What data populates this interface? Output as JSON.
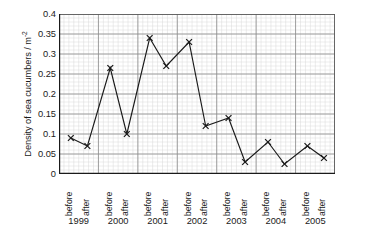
{
  "chart_data": {
    "type": "line",
    "title": "",
    "subtitle": "",
    "xlabel": "",
    "ylabel": "Density of sea cucumbers / m",
    "ylabel_exponent": "-2",
    "ylim": [
      0,
      0.4
    ],
    "ytick_labels": [
      "0",
      "0.05",
      "0.1",
      "0.15",
      "0.2",
      "0.25",
      "0.3",
      "0.35",
      "0.4"
    ],
    "ytick_values": [
      0,
      0.05,
      0.1,
      0.15,
      0.2,
      0.25,
      0.3,
      0.35,
      0.4
    ],
    "grid": "major and minor gridlines",
    "legend": "none",
    "marker": "x",
    "line_color": "#1a1a1a",
    "grid_major_color": "#8c8c8c",
    "grid_minor_color": "#d9d9d9",
    "years": [
      "1999",
      "2000",
      "2001",
      "2002",
      "2003",
      "2004",
      "2005"
    ],
    "categories": [
      "before",
      "after",
      "before",
      "after",
      "before",
      "after",
      "before",
      "after",
      "before",
      "after",
      "before",
      "after",
      "before",
      "after"
    ],
    "points": [
      {
        "year": "1999",
        "phase": "before",
        "value": 0.09
      },
      {
        "year": "1999",
        "phase": "after",
        "value": 0.07
      },
      {
        "year": "2000",
        "phase": "before",
        "value": 0.265
      },
      {
        "year": "2000",
        "phase": "after",
        "value": 0.1
      },
      {
        "year": "2001",
        "phase": "before",
        "value": 0.34
      },
      {
        "year": "2001",
        "phase": "after",
        "value": 0.27
      },
      {
        "year": "2002",
        "phase": "before",
        "value": 0.33
      },
      {
        "year": "2002",
        "phase": "after",
        "value": 0.12
      },
      {
        "year": "2003",
        "phase": "before",
        "value": 0.14
      },
      {
        "year": "2003",
        "phase": "after",
        "value": 0.03
      },
      {
        "year": "2004",
        "phase": "before",
        "value": 0.08
      },
      {
        "year": "2004",
        "phase": "after",
        "value": 0.025
      },
      {
        "year": "2005",
        "phase": "before",
        "value": 0.07
      },
      {
        "year": "2005",
        "phase": "after",
        "value": 0.04
      }
    ],
    "values": [
      0.09,
      0.07,
      0.265,
      0.1,
      0.34,
      0.27,
      0.33,
      0.12,
      0.14,
      0.03,
      0.08,
      0.025,
      0.07,
      0.04
    ]
  }
}
